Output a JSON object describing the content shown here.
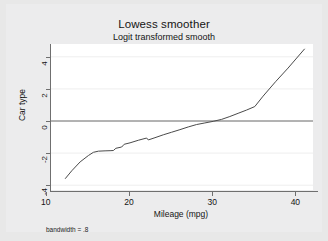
{
  "chart_data": {
    "type": "line",
    "title": "Lowess smoother",
    "subtitle": "Logit transformed smooth",
    "xlabel": "Mileage (mpg)",
    "ylabel": "Car type",
    "note": "bandwidth = .8",
    "xlim": [
      10.5,
      42
    ],
    "ylim": [
      -4.3,
      4.8
    ],
    "xticks": [
      10,
      20,
      30,
      40
    ],
    "xtick_labels": [
      "10",
      "20",
      "30",
      "40"
    ],
    "yticks": [
      4,
      2,
      0,
      -2,
      -4
    ],
    "ytick_labels": [
      "4",
      "2",
      "0",
      "-2",
      "-4"
    ],
    "grid": "horizontal-faint",
    "legend": "none",
    "reference_lines": [
      {
        "axis": "y",
        "value": 0,
        "color": "#6f6f6f"
      }
    ],
    "series": [
      {
        "name": "lowess smooth",
        "color": "#4a4a4a",
        "x": [
          12.2,
          13.0,
          14.0,
          15.0,
          15.6,
          16.2,
          17.0,
          17.6,
          18.0,
          18.3,
          19.0,
          19.3,
          20.0,
          21.0,
          22.0,
          22.2,
          23.0,
          24.0,
          25.0,
          26.0,
          27.0,
          28.0,
          29.0,
          30.0,
          31.0,
          32.0,
          33.0,
          34.0,
          35.0,
          36.0,
          37.5,
          39.0,
          41.0
        ],
        "y": [
          -3.6,
          -3.1,
          -2.55,
          -2.15,
          -1.95,
          -1.88,
          -1.86,
          -1.85,
          -1.84,
          -1.7,
          -1.62,
          -1.45,
          -1.36,
          -1.2,
          -1.06,
          -1.18,
          -1.04,
          -0.86,
          -0.7,
          -0.54,
          -0.37,
          -0.22,
          -0.12,
          -0.02,
          0.1,
          0.28,
          0.48,
          0.68,
          0.9,
          1.55,
          2.45,
          3.3,
          4.5
        ]
      }
    ]
  }
}
